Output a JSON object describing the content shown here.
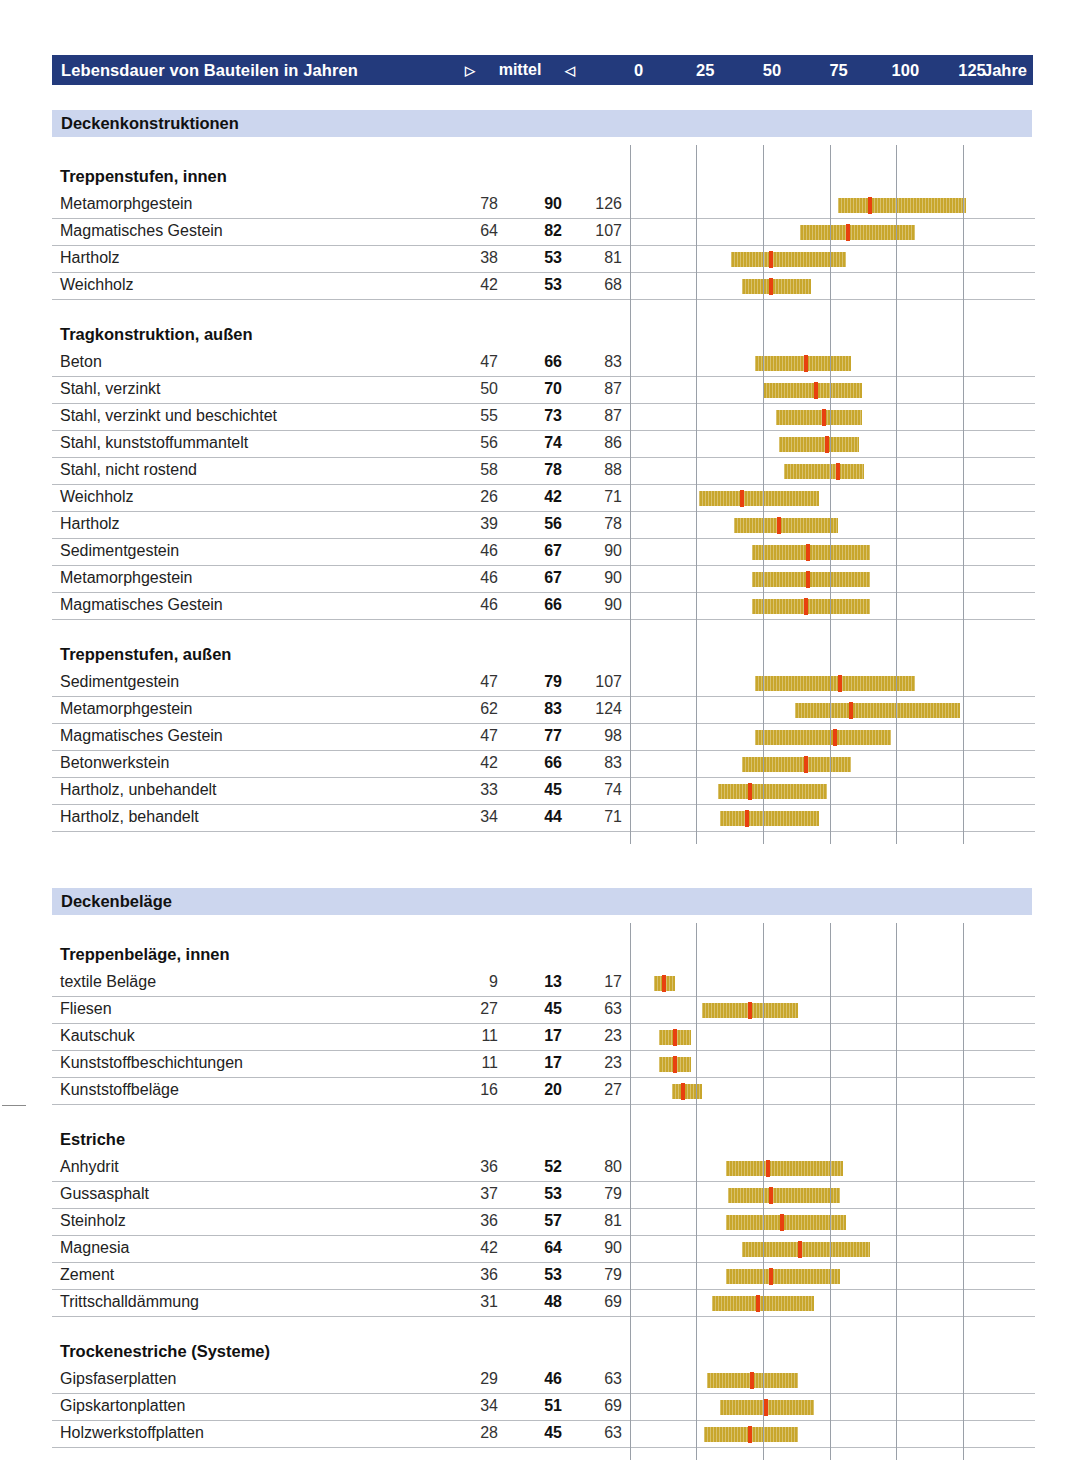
{
  "header": {
    "title": "Lebensdauer von Bauteilen in Jahren",
    "left_marker": "▷",
    "middle_label": "mittel",
    "right_marker": "◁",
    "unit": "Jahre",
    "ticks": [
      0,
      25,
      50,
      75,
      100,
      125
    ],
    "colors": {
      "bar": "#233a7c",
      "text": "#ffffff"
    }
  },
  "legend_colors": {
    "range_bar": "#c8a62c",
    "median_marker": "#e8400f",
    "section_band": "#ccd6ee"
  },
  "chart_data": {
    "type": "bar",
    "title": "Lebensdauer von Bauteilen in Jahren",
    "xlabel": "Jahre",
    "ylabel": "",
    "xlim": [
      0,
      125
    ],
    "xticks": [
      0,
      25,
      50,
      75,
      100,
      125
    ],
    "grid": true,
    "series_meaning": "Bereichsbalken von Minimum bis Maximum mit rotem Marker beim Mittelwert",
    "columns": [
      "min",
      "mittel",
      "max"
    ],
    "sections": [
      {
        "name": "Deckenkonstruktionen",
        "groups": [
          {
            "name": "Treppenstufen, innen",
            "rows": [
              {
                "label": "Metamorphgestein",
                "min": 78,
                "mid": 90,
                "max": 126
              },
              {
                "label": "Magmatisches Gestein",
                "min": 64,
                "mid": 82,
                "max": 107
              },
              {
                "label": "Hartholz",
                "min": 38,
                "mid": 53,
                "max": 81
              },
              {
                "label": "Weichholz",
                "min": 42,
                "mid": 53,
                "max": 68
              }
            ]
          },
          {
            "name": "Tragkonstruktion, außen",
            "rows": [
              {
                "label": "Beton",
                "min": 47,
                "mid": 66,
                "max": 83
              },
              {
                "label": "Stahl, verzinkt",
                "min": 50,
                "mid": 70,
                "max": 87
              },
              {
                "label": "Stahl, verzinkt und beschichtet",
                "min": 55,
                "mid": 73,
                "max": 87
              },
              {
                "label": "Stahl, kunststoffummantelt",
                "min": 56,
                "mid": 74,
                "max": 86
              },
              {
                "label": "Stahl, nicht rostend",
                "min": 58,
                "mid": 78,
                "max": 88
              },
              {
                "label": "Weichholz",
                "min": 26,
                "mid": 42,
                "max": 71
              },
              {
                "label": "Hartholz",
                "min": 39,
                "mid": 56,
                "max": 78
              },
              {
                "label": "Sedimentgestein",
                "min": 46,
                "mid": 67,
                "max": 90
              },
              {
                "label": "Metamorphgestein",
                "min": 46,
                "mid": 67,
                "max": 90
              },
              {
                "label": "Magmatisches Gestein",
                "min": 46,
                "mid": 66,
                "max": 90
              }
            ]
          },
          {
            "name": "Treppenstufen, außen",
            "rows": [
              {
                "label": "Sedimentgestein",
                "min": 47,
                "mid": 79,
                "max": 107
              },
              {
                "label": "Metamorphgestein",
                "min": 62,
                "mid": 83,
                "max": 124
              },
              {
                "label": "Magmatisches Gestein",
                "min": 47,
                "mid": 77,
                "max": 98
              },
              {
                "label": "Betonwerkstein",
                "min": 42,
                "mid": 66,
                "max": 83
              },
              {
                "label": "Hartholz, unbehandelt",
                "min": 33,
                "mid": 45,
                "max": 74
              },
              {
                "label": "Hartholz, behandelt",
                "min": 34,
                "mid": 44,
                "max": 71
              }
            ]
          }
        ]
      },
      {
        "name": "Deckenbeläge",
        "groups": [
          {
            "name": "Treppenbeläge, innen",
            "rows": [
              {
                "label": "textile Beläge",
                "min": 9,
                "mid": 13,
                "max": 17
              },
              {
                "label": "Fliesen",
                "min": 27,
                "mid": 45,
                "max": 63
              },
              {
                "label": "Kautschuk",
                "min": 11,
                "mid": 17,
                "max": 23
              },
              {
                "label": "Kunststoffbeschichtungen",
                "min": 11,
                "mid": 17,
                "max": 23
              },
              {
                "label": "Kunststoffbeläge",
                "min": 16,
                "mid": 20,
                "max": 27
              }
            ]
          },
          {
            "name": "Estriche",
            "rows": [
              {
                "label": "Anhydrit",
                "min": 36,
                "mid": 52,
                "max": 80
              },
              {
                "label": "Gussasphalt",
                "min": 37,
                "mid": 53,
                "max": 79
              },
              {
                "label": "Steinholz",
                "min": 36,
                "mid": 57,
                "max": 81
              },
              {
                "label": "Magnesia",
                "min": 42,
                "mid": 64,
                "max": 90
              },
              {
                "label": "Zement",
                "min": 36,
                "mid": 53,
                "max": 79
              },
              {
                "label": "Trittschalldämmung",
                "min": 31,
                "mid": 48,
                "max": 69
              }
            ]
          },
          {
            "name": "Trockenestriche (Systeme)",
            "rows": [
              {
                "label": "Gipsfaserplatten",
                "min": 29,
                "mid": 46,
                "max": 63
              },
              {
                "label": "Gipskartonplatten",
                "min": 34,
                "mid": 51,
                "max": 69
              },
              {
                "label": "Holzwerkstoffplatten",
                "min": 28,
                "mid": 45,
                "max": 63
              }
            ]
          }
        ]
      }
    ]
  }
}
